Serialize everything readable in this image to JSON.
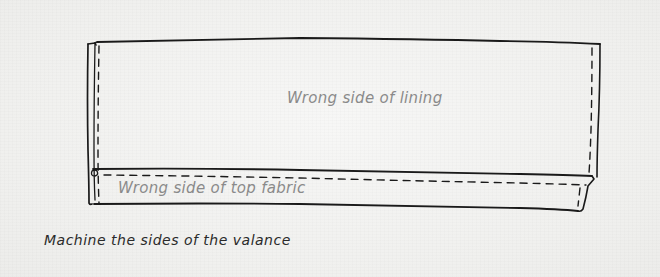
{
  "diagram": {
    "labels": {
      "lining": "Wrong side of lining",
      "top_fabric": "Wrong side of top fabric"
    },
    "caption": "Machine the sides of the valance",
    "colors": {
      "line": "#1a1a1a",
      "label_text": "#8a8a8a",
      "caption_text": "#2a2a2a",
      "background": "#f1f1ef"
    }
  }
}
